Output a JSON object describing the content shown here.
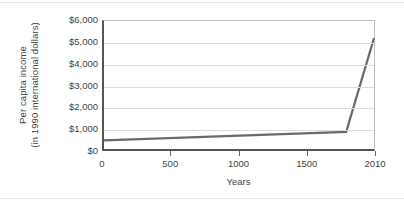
{
  "figure": {
    "background_color": "#ffffff",
    "axis_color": "#555555",
    "grid_color": "#dcdcdc",
    "page_rule_color": "#e6e6e8"
  },
  "chart_data": {
    "type": "line",
    "title": "",
    "xlabel": "Years",
    "ylabel": "Per capita income (in 1990 international dollars)",
    "ylabel_line1": "Per capita income",
    "ylabel_line2": "(in 1990 international dollars)",
    "line_color": "#6a6a6a",
    "line_width": 2.2,
    "grid": "horizontal",
    "legend": "none",
    "xlim": [
      0,
      2010
    ],
    "ylim": [
      0,
      6000
    ],
    "x_ticks": [
      0,
      500,
      1000,
      1500,
      2010
    ],
    "x_tick_labels": [
      "0",
      "500",
      "1000",
      "1500",
      "2010"
    ],
    "y_ticks": [
      0,
      1000,
      2000,
      3000,
      4000,
      5000,
      6000
    ],
    "y_tick_labels": [
      "$0",
      "$1,000",
      "$2,000",
      "$3,000",
      "$4,000",
      "$5,000",
      "$6,000"
    ],
    "series": [
      {
        "name": "Per capita income",
        "x": [
          0,
          1800,
          2010
        ],
        "values": [
          400,
          800,
          5200
        ]
      }
    ]
  }
}
